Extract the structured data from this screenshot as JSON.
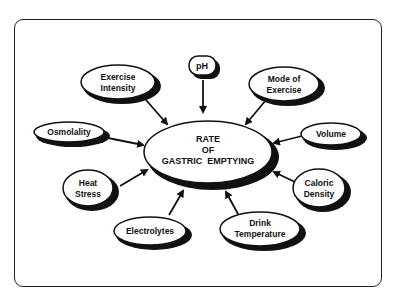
{
  "diagram": {
    "center": {
      "lines": [
        "RATE",
        "OF",
        "GASTRIC  EMPTYING"
      ]
    },
    "factors": [
      {
        "id": "exercise-intensity",
        "lines": [
          "Exercise",
          "Intensity"
        ]
      },
      {
        "id": "ph",
        "lines": [
          "pH"
        ]
      },
      {
        "id": "mode-of-exercise",
        "lines": [
          "Mode of",
          "Exercise"
        ]
      },
      {
        "id": "osmolality",
        "lines": [
          "Osmolality"
        ]
      },
      {
        "id": "volume",
        "lines": [
          "Volume"
        ]
      },
      {
        "id": "heat-stress",
        "lines": [
          "Heat",
          "Stress"
        ]
      },
      {
        "id": "caloric-density",
        "lines": [
          "Caloric",
          "Density"
        ]
      },
      {
        "id": "electrolytes",
        "lines": [
          "Electrolytes"
        ]
      },
      {
        "id": "drink-temperature",
        "lines": [
          "Drink",
          "Temperature"
        ]
      }
    ]
  }
}
